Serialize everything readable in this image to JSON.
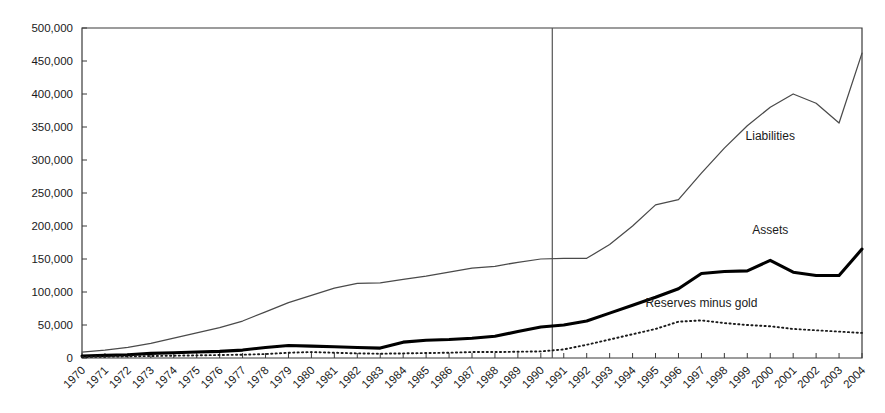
{
  "chart_data": {
    "type": "line",
    "title": "",
    "subtitle": "",
    "xlabel": "",
    "ylabel": "",
    "grid": false,
    "legend_position": "inline-annotations",
    "x": [
      1970,
      1971,
      1972,
      1973,
      1974,
      1975,
      1976,
      1977,
      1978,
      1979,
      1980,
      1981,
      1982,
      1983,
      1984,
      1985,
      1986,
      1987,
      1988,
      1989,
      1990,
      1991,
      1992,
      1993,
      1994,
      1995,
      1996,
      1997,
      1998,
      1999,
      2000,
      2001,
      2002,
      2003,
      2004
    ],
    "xlim": [
      1970,
      2004
    ],
    "ylim": [
      0,
      500000
    ],
    "ytick_labels": [
      "0",
      "50,000",
      "100,000",
      "150,000",
      "200,000",
      "250,000",
      "300,000",
      "350,000",
      "400,000",
      "450,000",
      "500,000"
    ],
    "ytick_values": [
      0,
      50000,
      100000,
      150000,
      200000,
      250000,
      300000,
      350000,
      400000,
      450000,
      500000
    ],
    "xtick_labels": [
      "1970",
      "1971",
      "1972",
      "1973",
      "1974",
      "1975",
      "1976",
      "1977",
      "1978",
      "1979",
      "1980",
      "1981",
      "1982",
      "1983",
      "1984",
      "1985",
      "1986",
      "1987",
      "1988",
      "1989",
      "1990",
      "1991",
      "1992",
      "1993",
      "1994",
      "1995",
      "1996",
      "1997",
      "1998",
      "1999",
      "2000",
      "2001",
      "2002",
      "2003",
      "2004"
    ],
    "series": [
      {
        "name": "Liabilities",
        "style": "solid-thin",
        "color": "#4a4a4a",
        "label_x": 2000,
        "label_y": 330000,
        "values": [
          9000,
          12000,
          16000,
          22000,
          30000,
          38000,
          46000,
          56000,
          70000,
          84000,
          95000,
          106000,
          113000,
          114000,
          119000,
          124000,
          130000,
          136000,
          139000,
          145000,
          150000,
          151000,
          151000,
          172000,
          200000,
          232000,
          240000,
          280000,
          318000,
          352000,
          380000,
          400000,
          386000,
          356000,
          462000
        ]
      },
      {
        "name": "Assets",
        "style": "solid-thick",
        "color": "#000000",
        "label_x": 2000,
        "label_y": 188000,
        "values": [
          3000,
          4000,
          5000,
          7000,
          8000,
          9000,
          10000,
          12000,
          16000,
          19000,
          18000,
          17000,
          16000,
          15000,
          24000,
          27000,
          28000,
          30000,
          33000,
          40000,
          47000,
          50000,
          56000,
          68000,
          80000,
          92000,
          105000,
          128000,
          131000,
          132000,
          148000,
          130000,
          125000,
          125000,
          165000
        ]
      },
      {
        "name": "Reserves minus gold",
        "style": "dotted",
        "color": "#1a1a1a",
        "label_x": 1997,
        "label_y": 78000,
        "values": [
          1500,
          2000,
          2500,
          3000,
          3500,
          4000,
          4500,
          5000,
          6000,
          8000,
          9000,
          8000,
          7000,
          6500,
          7000,
          7500,
          8000,
          9000,
          9000,
          9500,
          10000,
          13000,
          20000,
          28000,
          36000,
          44000,
          55000,
          57000,
          53000,
          50000,
          48000,
          44000,
          42000,
          40000,
          38000
        ]
      }
    ],
    "annotations": [
      {
        "text": "Liabilities",
        "x": 2000,
        "y": 330000
      },
      {
        "text": "Assets",
        "x": 2000,
        "y": 188000
      },
      {
        "text": "Reserves minus gold",
        "x": 1997,
        "y": 78000
      }
    ],
    "reference_line": {
      "type": "vertical",
      "x": 1990.5,
      "color": "#555555"
    }
  }
}
